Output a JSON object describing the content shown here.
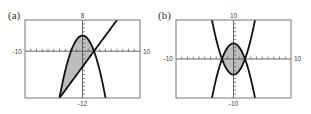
{
  "chart_data": [
    {
      "panel": "(a)",
      "type": "line",
      "title": "",
      "xlim": [
        -10,
        10
      ],
      "ylim": [
        -12,
        8
      ],
      "tick_labels": {
        "x_left": "-10",
        "x_right": "10",
        "y_top": "8",
        "y_bottom": "-12"
      },
      "grid": false,
      "tick_step": 1,
      "series": [
        {
          "name": "parabola",
          "equation": "y = 4 - x^2",
          "a": -1,
          "b": 0,
          "c": 4
        },
        {
          "name": "line",
          "equation": "y = 2x - 4",
          "a": 0,
          "b": 2,
          "c": -4
        }
      ],
      "shaded_region": {
        "between": [
          "parabola",
          "line"
        ],
        "x_from": -4,
        "x_to": 2
      },
      "intersections": [
        [
          -4,
          -12
        ],
        [
          2,
          0
        ]
      ]
    },
    {
      "panel": "(b)",
      "type": "line",
      "title": "",
      "xlim": [
        -10,
        10
      ],
      "ylim": [
        -10,
        10
      ],
      "tick_labels": {
        "x_left": "-10",
        "x_right": "10",
        "y_top": "10",
        "y_bottom": "-10"
      },
      "grid": false,
      "tick_step": 1,
      "series": [
        {
          "name": "downward parabola",
          "equation": "y = 4 - x^2",
          "a": -1,
          "b": 0,
          "c": 4
        },
        {
          "name": "upward parabola",
          "equation": "y = x^2 - 4",
          "a": 1,
          "b": 0,
          "c": -4
        }
      ],
      "shaded_region": {
        "between": [
          "downward parabola",
          "upward parabola"
        ],
        "x_from": -2,
        "x_to": 2
      },
      "intersections": [
        [
          -2,
          0
        ],
        [
          2,
          0
        ]
      ]
    }
  ],
  "layout": {
    "panels": [
      {
        "frame": {
          "x": 25,
          "y": 20,
          "w": 115,
          "h": 78
        },
        "label_pos": [
          8,
          19
        ]
      },
      {
        "frame": {
          "x": 176,
          "y": 20,
          "w": 115,
          "h": 78
        },
        "label_pos": [
          158,
          19
        ]
      }
    ]
  },
  "colors": {
    "curve": "#111111",
    "shade": "#bdbdbd",
    "frame": "#777777"
  }
}
